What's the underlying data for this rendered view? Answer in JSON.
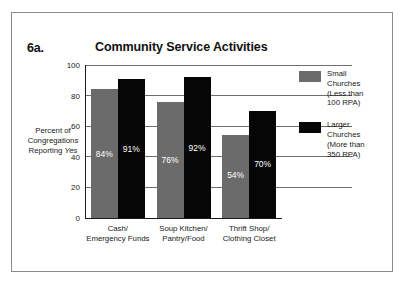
{
  "figure": {
    "number": "6a.",
    "frame_border_color": "#8c8c8c"
  },
  "chart_data": {
    "type": "bar",
    "title": "Community Service Activities",
    "xlabel": "",
    "ylabel_lines": [
      "Percent of",
      "Congregations",
      "Reporting ",
      "Yes"
    ],
    "ylabel_plain": "Percent of Congregations Reporting Yes",
    "categories": [
      {
        "line1": "Cash/",
        "line2": "Emergency Funds"
      },
      {
        "line1": "Soup Kitchen/",
        "line2": "Pantry/Food"
      },
      {
        "line1": "Thrift Shop/",
        "line2": "Clothing Closet"
      }
    ],
    "ylim": [
      0,
      100
    ],
    "yticks": [
      "0",
      "20",
      "40",
      "60",
      "80",
      "100"
    ],
    "grid": true,
    "legend_position": "right",
    "series": [
      {
        "name": "Small Churches (Less than 100 RPA)",
        "legend_lines": [
          "Small",
          "Churches",
          "(Less than",
          "100 RPA)"
        ],
        "color": "#6b6b6b",
        "values": [
          84,
          76,
          54
        ],
        "labels": [
          "84%",
          "76%",
          "54%"
        ]
      },
      {
        "name": "Larger Churches (More than 350 RPA)",
        "legend_lines": [
          "Larger",
          "Churches",
          "(More than",
          "350 RPA)"
        ],
        "color": "#060606",
        "values": [
          91,
          92,
          70
        ],
        "labels": [
          "91%",
          "92%",
          "70%"
        ]
      }
    ]
  }
}
